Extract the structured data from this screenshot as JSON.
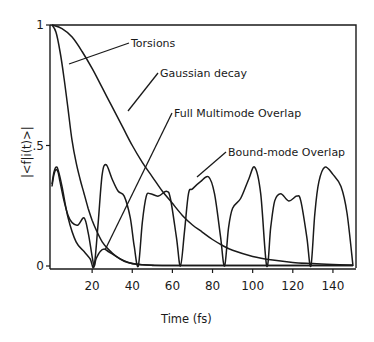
{
  "chart_data": {
    "type": "line",
    "title": "",
    "xlabel": "Time (fs)",
    "ylabel": "|<f|i(t)>|",
    "xlim": [
      0,
      150
    ],
    "ylim": [
      0,
      1
    ],
    "grid": false,
    "legend": "inline annotations with leader lines",
    "x_ticks": [
      20,
      40,
      60,
      80,
      100,
      120,
      140
    ],
    "x_tick_labels": [
      "20",
      "40",
      "60",
      "80",
      "100",
      "120",
      "140"
    ],
    "y_ticks": [
      0,
      0.5,
      1
    ],
    "y_tick_labels": [
      "0",
      ".5",
      "1"
    ],
    "series": [
      {
        "name": "Torsions",
        "x": [
          0,
          2,
          4,
          6,
          8,
          10,
          12,
          14,
          16,
          18,
          20,
          22,
          25,
          28,
          32,
          36,
          40,
          45,
          50,
          60,
          80,
          100,
          150
        ],
        "values": [
          1.0,
          0.97,
          0.89,
          0.78,
          0.65,
          0.52,
          0.43,
          0.36,
          0.3,
          0.24,
          0.19,
          0.15,
          0.1,
          0.07,
          0.04,
          0.02,
          0.01,
          0.005,
          0.003,
          0.002,
          0.002,
          0.002,
          0.002
        ]
      },
      {
        "name": "Gaussian decay",
        "x": [
          0,
          5,
          10,
          15,
          20,
          25,
          30,
          35,
          40,
          45,
          50,
          55,
          60,
          65,
          70,
          75,
          80,
          85,
          90,
          100,
          110,
          120,
          130,
          140,
          150
        ],
        "values": [
          1.0,
          0.985,
          0.95,
          0.89,
          0.82,
          0.74,
          0.66,
          0.58,
          0.5,
          0.43,
          0.37,
          0.31,
          0.26,
          0.21,
          0.17,
          0.14,
          0.11,
          0.085,
          0.065,
          0.04,
          0.025,
          0.015,
          0.01,
          0.006,
          0.004
        ]
      },
      {
        "name": "Full Multimode Overlap",
        "x": [
          0,
          1,
          2,
          3,
          4,
          6,
          8,
          10,
          13,
          16,
          18,
          20,
          21,
          22,
          24,
          26,
          28,
          30,
          34,
          38,
          42,
          50,
          60,
          150
        ],
        "values": [
          0.33,
          0.38,
          0.4,
          0.39,
          0.35,
          0.27,
          0.21,
          0.18,
          0.17,
          0.2,
          0.14,
          0.04,
          0.0,
          0.03,
          0.06,
          0.07,
          0.06,
          0.05,
          0.03,
          0.015,
          0.007,
          0.003,
          0.002,
          0.002
        ]
      },
      {
        "name": "Bound-mode Overlap",
        "x": [
          0,
          1,
          2,
          3,
          5,
          8,
          12,
          16,
          19,
          21,
          23,
          25,
          27,
          30,
          33,
          36,
          39,
          41,
          43,
          45,
          47,
          49,
          53,
          57,
          59,
          62,
          64,
          66,
          68,
          70,
          74,
          78,
          81,
          84,
          86,
          88,
          90,
          94,
          98,
          101,
          104,
          107,
          109,
          111,
          114,
          118,
          122,
          124,
          127,
          129,
          131,
          133,
          136,
          140,
          144,
          147,
          150
        ],
        "values": [
          0.34,
          0.39,
          0.41,
          0.4,
          0.33,
          0.2,
          0.1,
          0.06,
          0.03,
          0.0,
          0.18,
          0.38,
          0.42,
          0.36,
          0.31,
          0.29,
          0.2,
          0.08,
          0.0,
          0.18,
          0.29,
          0.3,
          0.29,
          0.31,
          0.28,
          0.12,
          0.0,
          0.14,
          0.3,
          0.32,
          0.35,
          0.37,
          0.3,
          0.12,
          0.0,
          0.16,
          0.24,
          0.28,
          0.36,
          0.41,
          0.3,
          0.0,
          0.16,
          0.27,
          0.3,
          0.27,
          0.29,
          0.27,
          0.12,
          0.0,
          0.22,
          0.35,
          0.41,
          0.38,
          0.33,
          0.22,
          0.0
        ]
      }
    ],
    "annotations": [
      {
        "text": "Torsions",
        "target_series": "Torsions"
      },
      {
        "text": "Gaussian decay",
        "target_series": "Gaussian decay"
      },
      {
        "text": "Full Multimode Overlap",
        "target_series": "Full Multimode Overlap"
      },
      {
        "text": "Bound-mode Overlap",
        "target_series": "Bound-mode Overlap"
      }
    ]
  },
  "labels": {
    "xlabel": "Time (fs)",
    "ylabel": "|<f|i(t)>|",
    "torsions": "Torsions",
    "gaussian": "Gaussian decay",
    "full": "Full Multimode Overlap",
    "bound": "Bound-mode Overlap"
  },
  "colors": {
    "ink": "#1a1a1a",
    "background": "#ffffff"
  }
}
